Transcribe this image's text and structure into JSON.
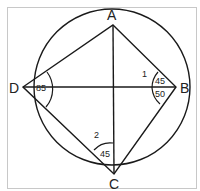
{
  "diagram": {
    "points": {
      "A": {
        "label": "A"
      },
      "B": {
        "label": "B"
      },
      "C": {
        "label": "C"
      },
      "D": {
        "label": "D"
      }
    },
    "angles": {
      "D": "85",
      "B_upper": "45",
      "B_lower": "50",
      "C": "45",
      "marker_1": "1",
      "marker_2": "2"
    },
    "colors": {
      "stroke": "#1a1a1a",
      "frame": "#cccccc"
    }
  }
}
